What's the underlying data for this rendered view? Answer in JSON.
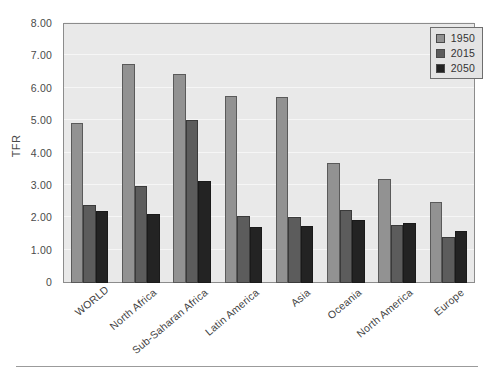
{
  "chart_data": {
    "type": "bar",
    "title": "",
    "xlabel": "",
    "ylabel": "TFR",
    "ylim": [
      0,
      8
    ],
    "ytick_labels": [
      "0",
      "1.00",
      "2.00",
      "3.00",
      "4.00",
      "5.00",
      "6.00",
      "7.00",
      "8.00"
    ],
    "ytick_values": [
      0,
      1,
      2,
      3,
      4,
      5,
      6,
      7,
      8
    ],
    "grid": true,
    "legend_position": "top-right",
    "categories": [
      "WORLD",
      "North Africa",
      "Sub-Saharan Africa",
      "Latin America",
      "Asia",
      "Oceania",
      "North America",
      "Europe"
    ],
    "series": [
      {
        "name": "1950",
        "color": "#929292",
        "values": [
          4.95,
          6.78,
          6.45,
          5.78,
          5.76,
          3.72,
          3.22,
          2.5
        ]
      },
      {
        "name": "2015",
        "color": "#5c5c5c",
        "values": [
          2.42,
          3.0,
          5.02,
          2.08,
          2.05,
          2.25,
          1.8,
          1.42
        ]
      },
      {
        "name": "2050",
        "color": "#232323",
        "values": [
          2.22,
          2.13,
          3.15,
          1.73,
          1.75,
          1.95,
          1.85,
          1.6
        ]
      }
    ]
  }
}
